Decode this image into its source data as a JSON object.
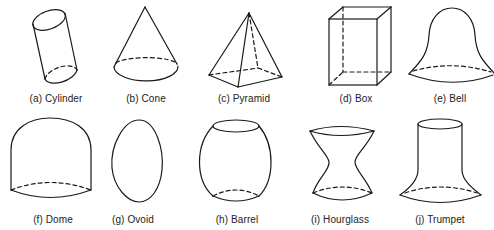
{
  "figure": {
    "shapes": [
      {
        "id": "a",
        "label": "(a) Cylinder"
      },
      {
        "id": "b",
        "label": "(b) Cone"
      },
      {
        "id": "c",
        "label": "(c) Pyramid"
      },
      {
        "id": "d",
        "label": "(d) Box"
      },
      {
        "id": "e",
        "label": "(e) Bell"
      },
      {
        "id": "f",
        "label": "(f) Dome"
      },
      {
        "id": "g",
        "label": "(g) Ovoid"
      },
      {
        "id": "h",
        "label": "(h) Barrel"
      },
      {
        "id": "i",
        "label": "(i) Hourglass"
      },
      {
        "id": "j",
        "label": "(j) Trumpet"
      }
    ],
    "colors": {
      "stroke": "#1a1a1a",
      "text": "#222222",
      "background": "#ffffff"
    }
  }
}
